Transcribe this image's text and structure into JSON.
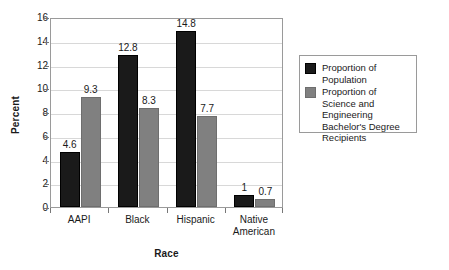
{
  "chart_data": {
    "type": "bar",
    "title": "",
    "xlabel": "Race",
    "ylabel": "Percent",
    "ylim": [
      0,
      16
    ],
    "ytick_step": 2,
    "yticks": [
      "16",
      "14",
      "12",
      "10",
      "8",
      "6",
      "4",
      "2",
      "0"
    ],
    "grid": "horizontal",
    "legend_position": "right",
    "categories": [
      "AAPI",
      "Black",
      "Hispanic",
      "Native American"
    ],
    "category_lines": [
      [
        "AAPI"
      ],
      [
        "Black"
      ],
      [
        "Hispanic"
      ],
      [
        "Native",
        "American"
      ]
    ],
    "series": [
      {
        "name": "Proportion of Population",
        "color": "#1a1a1a",
        "values": [
          4.6,
          12.8,
          14.8,
          1
        ],
        "labels": [
          "4.6",
          "12.8",
          "14.8",
          "1"
        ]
      },
      {
        "name": "Proportion of Science and Engineering Bachelor's Degree Recipients",
        "color": "#808080",
        "values": [
          9.3,
          8.3,
          7.7,
          0.7
        ],
        "labels": [
          "9.3",
          "8.3",
          "7.7",
          "0.7"
        ]
      }
    ],
    "legend_entries": [
      {
        "label": "Proportion of Population",
        "color": "#1a1a1a"
      },
      {
        "label": "Proportion of Science and Engineering Bachelor's Degree Recipients",
        "color": "#808080"
      }
    ]
  }
}
